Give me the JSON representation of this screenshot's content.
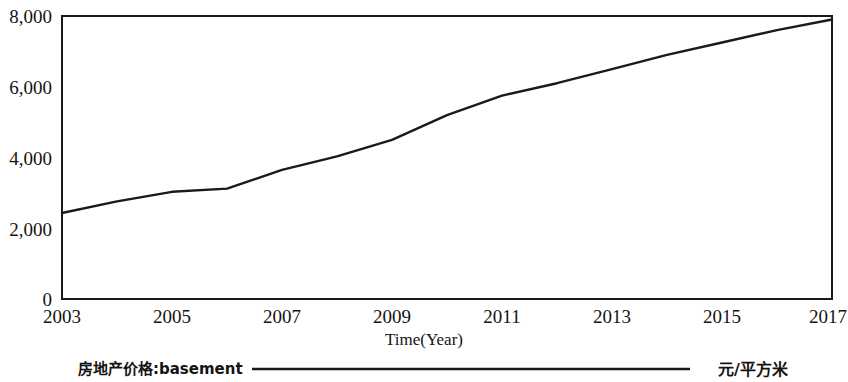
{
  "chart_data": {
    "type": "line",
    "title": "",
    "xlabel": "Time(Year)",
    "ylabel": "",
    "xlim": [
      2003,
      2017
    ],
    "ylim": [
      0,
      8000
    ],
    "grid": false,
    "legend_position": "bottom",
    "x_ticks": [
      "2003",
      "2005",
      "2007",
      "2009",
      "2011",
      "2013",
      "2015",
      "2017"
    ],
    "y_ticks": [
      "0",
      "2,000",
      "4,000",
      "6,000",
      "8,000"
    ],
    "x": [
      2003,
      2004,
      2005,
      2006,
      2007,
      2008,
      2009,
      2010,
      2011,
      2012,
      2013,
      2014,
      2015,
      2016,
      2017
    ],
    "series": [
      {
        "name": "房地产价格:basement",
        "unit": "元/平方米",
        "color": "#1a1a1a",
        "values": [
          2430,
          2760,
          3030,
          3120,
          3650,
          4030,
          4500,
          5200,
          5750,
          6100,
          6500,
          6900,
          7250,
          7600,
          7900
        ]
      }
    ],
    "annotations": []
  },
  "axis": {
    "x_title": "Time(Year)",
    "ticks_x": [
      "2003",
      "2005",
      "2007",
      "2009",
      "2011",
      "2013",
      "2015",
      "2017"
    ],
    "ticks_y": [
      "8,000",
      "6,000",
      "4,000",
      "2,000",
      "0"
    ]
  },
  "legend": {
    "series_label": "房地产价格:basement",
    "unit_label": "元/平方米"
  }
}
